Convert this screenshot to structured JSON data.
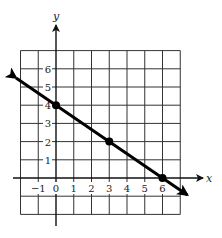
{
  "chart_data": {
    "type": "line",
    "title": "",
    "xlabel": "x",
    "ylabel": "y",
    "xlim": [
      -2,
      7
    ],
    "ylim": [
      -2,
      7
    ],
    "grid": true,
    "x_ticks": [
      "−1",
      "0",
      "1",
      "2",
      "3",
      "4",
      "5",
      "6"
    ],
    "y_ticks": [
      "1",
      "2",
      "3",
      "4",
      "5",
      "6"
    ],
    "series": [
      {
        "name": "line",
        "equation": "y = -2/3 x + 4",
        "arrows": "both",
        "points": [
          {
            "x": 0,
            "y": 4
          },
          {
            "x": 3,
            "y": 2
          },
          {
            "x": 6,
            "y": 0
          }
        ]
      }
    ],
    "legend": null
  },
  "colors": {
    "line": "#000000",
    "grid": "#333333",
    "background": "#ffffff"
  }
}
